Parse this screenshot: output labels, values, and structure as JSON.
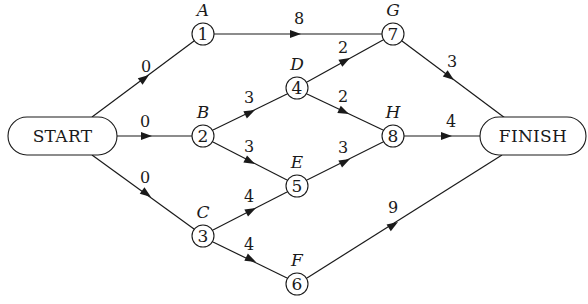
{
  "diagram": {
    "type": "activity-network",
    "terminals": {
      "start": {
        "label": "START"
      },
      "finish": {
        "label": "FINISH"
      }
    },
    "nodes": [
      {
        "id": "1",
        "number": "1",
        "task": "A"
      },
      {
        "id": "2",
        "number": "2",
        "task": "B"
      },
      {
        "id": "3",
        "number": "3",
        "task": "C"
      },
      {
        "id": "4",
        "number": "4",
        "task": "D"
      },
      {
        "id": "5",
        "number": "5",
        "task": "E"
      },
      {
        "id": "6",
        "number": "6",
        "task": "F"
      },
      {
        "id": "7",
        "number": "7",
        "task": "G"
      },
      {
        "id": "8",
        "number": "8",
        "task": "H"
      }
    ],
    "edges": [
      {
        "from": "START",
        "to": "1",
        "weight": "0"
      },
      {
        "from": "START",
        "to": "2",
        "weight": "0"
      },
      {
        "from": "START",
        "to": "3",
        "weight": "0"
      },
      {
        "from": "1",
        "to": "7",
        "weight": "8"
      },
      {
        "from": "2",
        "to": "4",
        "weight": "3"
      },
      {
        "from": "2",
        "to": "5",
        "weight": "3"
      },
      {
        "from": "3",
        "to": "5",
        "weight": "4"
      },
      {
        "from": "3",
        "to": "6",
        "weight": "4"
      },
      {
        "from": "4",
        "to": "7",
        "weight": "2"
      },
      {
        "from": "4",
        "to": "8",
        "weight": "2"
      },
      {
        "from": "5",
        "to": "8",
        "weight": "3"
      },
      {
        "from": "7",
        "to": "FINISH",
        "weight": "3"
      },
      {
        "from": "8",
        "to": "FINISH",
        "weight": "4"
      },
      {
        "from": "6",
        "to": "FINISH",
        "weight": "9"
      }
    ]
  }
}
